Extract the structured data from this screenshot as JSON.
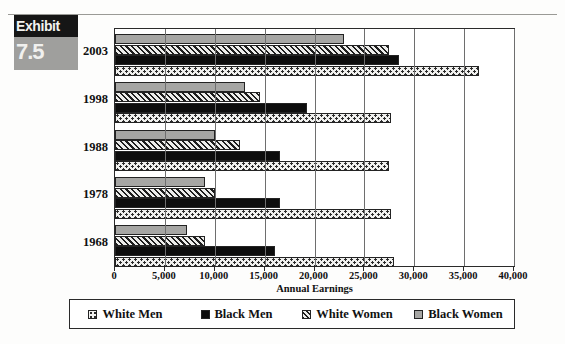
{
  "exhibit": {
    "word": "Exhibit",
    "number": "7.5"
  },
  "chart_data": {
    "type": "bar",
    "orientation": "horizontal",
    "title": "",
    "xlabel": "Annual Earnings",
    "ylabel": "",
    "xlim": [
      0,
      40000
    ],
    "xticks": [
      "0",
      "5,000",
      "10,000",
      "15,000",
      "20,000",
      "25,000",
      "30,000",
      "35,000",
      "40,000"
    ],
    "xtick_values": [
      0,
      5000,
      10000,
      15000,
      20000,
      25000,
      30000,
      35000,
      40000
    ],
    "grid": true,
    "legend_position": "bottom",
    "categories": [
      "2003",
      "1998",
      "1988",
      "1978",
      "1968"
    ],
    "series": [
      {
        "name": "White Men",
        "pattern": "dotted",
        "color": "#f0f0ee",
        "values": [
          36500,
          27700,
          27500,
          27700,
          28000
        ]
      },
      {
        "name": "Black Men",
        "pattern": "solid-black",
        "color": "#0d0d0d",
        "values": [
          28500,
          19200,
          16500,
          16500,
          16000
        ]
      },
      {
        "name": "White Women",
        "pattern": "diagonal-hatch",
        "color": "#ededeb",
        "values": [
          27500,
          14500,
          12500,
          10000,
          9000
        ]
      },
      {
        "name": "Black Women",
        "pattern": "solid-gray",
        "color": "#a6a6a4",
        "values": [
          23000,
          13000,
          10000,
          9000,
          7200
        ]
      }
    ]
  }
}
